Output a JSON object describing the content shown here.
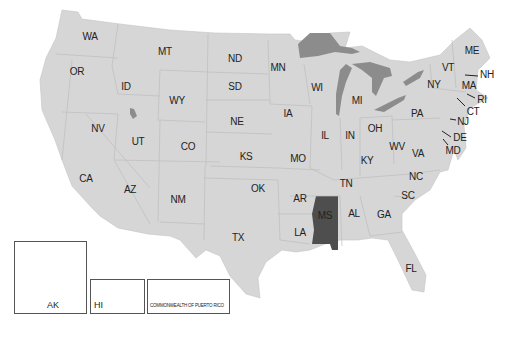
{
  "map": {
    "title": "United States",
    "highlighted_state": "MS",
    "colors": {
      "land": "#d4d4d4",
      "border": "#b8b8b8",
      "highlight": "#555555",
      "water": "#8a8a8a",
      "background": "#ffffff"
    },
    "states": [
      {
        "code": "WA",
        "x": 90,
        "y": 36
      },
      {
        "code": "OR",
        "x": 77,
        "y": 71
      },
      {
        "code": "MT",
        "x": 165,
        "y": 51
      },
      {
        "code": "ND",
        "x": 235,
        "y": 58
      },
      {
        "code": "ID",
        "x": 126,
        "y": 86
      },
      {
        "code": "WY",
        "x": 177,
        "y": 100
      },
      {
        "code": "SD",
        "x": 235,
        "y": 86
      },
      {
        "code": "MN",
        "x": 278,
        "y": 67
      },
      {
        "code": "WI",
        "x": 317,
        "y": 87
      },
      {
        "code": "MI",
        "x": 357,
        "y": 100
      },
      {
        "code": "NY",
        "x": 434,
        "y": 84
      },
      {
        "code": "VT",
        "x": 448,
        "y": 67
      },
      {
        "code": "ME",
        "x": 472,
        "y": 50
      },
      {
        "code": "NH",
        "x": 487,
        "y": 74
      },
      {
        "code": "MA",
        "x": 469,
        "y": 85
      },
      {
        "code": "RI",
        "x": 482,
        "y": 99
      },
      {
        "code": "CT",
        "x": 473,
        "y": 111
      },
      {
        "code": "NJ",
        "x": 463,
        "y": 121
      },
      {
        "code": "DE",
        "x": 460,
        "y": 137
      },
      {
        "code": "MD",
        "x": 453,
        "y": 150
      },
      {
        "code": "PA",
        "x": 417,
        "y": 113
      },
      {
        "code": "OH",
        "x": 375,
        "y": 128
      },
      {
        "code": "IN",
        "x": 350,
        "y": 135
      },
      {
        "code": "IL",
        "x": 325,
        "y": 135
      },
      {
        "code": "IA",
        "x": 288,
        "y": 113
      },
      {
        "code": "NE",
        "x": 237,
        "y": 121
      },
      {
        "code": "NV",
        "x": 98,
        "y": 128
      },
      {
        "code": "UT",
        "x": 138,
        "y": 141
      },
      {
        "code": "CO",
        "x": 188,
        "y": 146
      },
      {
        "code": "KS",
        "x": 246,
        "y": 156
      },
      {
        "code": "MO",
        "x": 298,
        "y": 158
      },
      {
        "code": "KY",
        "x": 367,
        "y": 160
      },
      {
        "code": "WV",
        "x": 397,
        "y": 146
      },
      {
        "code": "VA",
        "x": 418,
        "y": 153
      },
      {
        "code": "CA",
        "x": 86,
        "y": 178
      },
      {
        "code": "AZ",
        "x": 130,
        "y": 189
      },
      {
        "code": "NM",
        "x": 178,
        "y": 199
      },
      {
        "code": "OK",
        "x": 258,
        "y": 188
      },
      {
        "code": "AR",
        "x": 300,
        "y": 198
      },
      {
        "code": "TN",
        "x": 346,
        "y": 183
      },
      {
        "code": "NC",
        "x": 416,
        "y": 176
      },
      {
        "code": "SC",
        "x": 408,
        "y": 195
      },
      {
        "code": "GA",
        "x": 384,
        "y": 214
      },
      {
        "code": "AL",
        "x": 354,
        "y": 213
      },
      {
        "code": "MS",
        "x": 325,
        "y": 215
      },
      {
        "code": "LA",
        "x": 300,
        "y": 232
      },
      {
        "code": "TX",
        "x": 238,
        "y": 237
      },
      {
        "code": "FL",
        "x": 411,
        "y": 268
      }
    ],
    "insets": [
      {
        "code": "AK",
        "label": "AK"
      },
      {
        "code": "HI",
        "label": "HI"
      },
      {
        "code": "PR",
        "label": "COMMONWEALTH OF PUERTO RICO"
      }
    ]
  }
}
